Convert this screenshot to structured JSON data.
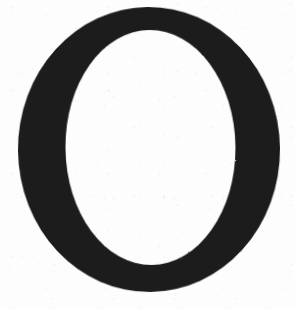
{
  "document": {
    "kind": "scanned-letterform",
    "character": "O",
    "description": "Scanned capital letter O in a high-contrast Didone serif face",
    "canvas": {
      "width": 295,
      "height": 309
    }
  },
  "colors": {
    "ink": "#1a1a1a",
    "ink_edge": "#2a2a2a",
    "paper": "#fdfdfd",
    "page_background": "#ffffff"
  },
  "glyph": {
    "name": "letter-o",
    "character": "O",
    "style": "didone-serif-high-contrast",
    "fill": "#1a1a1a",
    "rotation_degrees": -0.6,
    "outer_ellipse": {
      "center_x": 149,
      "center_y": 149.5,
      "radius_x": 131,
      "radius_y": 142.5,
      "left": 18,
      "right": 280,
      "top": 7,
      "bottom": 292
    },
    "inner_counter": {
      "center_x": 150.5,
      "center_y": 147.5,
      "radius_x": 85,
      "radius_y": 117.5,
      "left": 65.5,
      "right": 235.5,
      "top": 30,
      "bottom": 265,
      "fill": "#fdfdfd"
    },
    "stroke_weights": {
      "left_side": 47,
      "right_side": 44,
      "top": 23,
      "bottom": 27,
      "contrast_ratio": "2.0"
    }
  },
  "texture": {
    "name": "scan-speckle",
    "paper_noise_opacity": 0.05,
    "ink_grain_opacity": 0.3
  }
}
